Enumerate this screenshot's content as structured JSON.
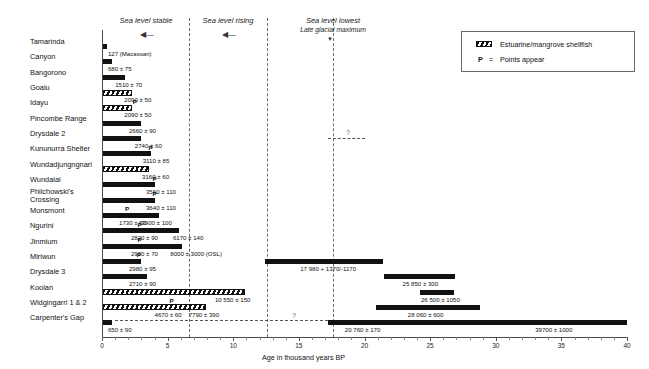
{
  "chart_data": {
    "type": "bar",
    "title": "",
    "xlabel": "Age in thousand years BP",
    "ylabel": "",
    "xlim": [
      0,
      40
    ],
    "xticks": [
      0,
      5,
      10,
      15,
      20,
      25,
      30,
      35,
      40
    ],
    "xtick_labels": [
      "0",
      "5",
      "10",
      "15",
      "20",
      "25",
      "30",
      "35",
      "40"
    ],
    "grid": false,
    "orientation": "horizontal",
    "categories": [
      "Tamarinda",
      "Canyon",
      "Bangorono",
      "Goalu",
      "Idayu",
      "Pincombe Range",
      "Drysdale 2",
      "Kununurra Shelter",
      "Wundadjungngnari",
      "Wundalal",
      "Philchowski's\nCrossing",
      "Monsmont",
      "Ngurini",
      "Jinmium",
      "Miriwun",
      "Drysdale 3",
      "Koolan",
      "Widgingarri 1 & 2",
      "Carpenter's Gap"
    ],
    "bars": [
      {
        "site": "Tamarinda",
        "segments": [
          {
            "start": 0.0,
            "end": 0.35,
            "style": "solid"
          }
        ],
        "labels": [
          {
            "text": "127 (Macassan)",
            "x": 0.45
          }
        ],
        "points": []
      },
      {
        "site": "Canyon",
        "segments": [
          {
            "start": 0.0,
            "end": 0.75,
            "style": "solid"
          }
        ],
        "labels": [
          {
            "text": "680 ± 75",
            "x": 0.45
          }
        ],
        "points": []
      },
      {
        "site": "Bangorono",
        "segments": [
          {
            "start": 0.0,
            "end": 1.75,
            "style": "solid"
          }
        ],
        "labels": [
          {
            "text": "1510 ± 70",
            "x": 1.0
          }
        ],
        "points": []
      },
      {
        "site": "Goalu",
        "segments": [
          {
            "start": 0.0,
            "end": 2.25,
            "style": "hatch"
          }
        ],
        "labels": [
          {
            "text": "2090 ± 50",
            "x": 1.7
          }
        ],
        "points": []
      },
      {
        "site": "Idayu",
        "segments": [
          {
            "start": 0.0,
            "end": 2.25,
            "style": "hatch"
          }
        ],
        "labels": [
          {
            "text": "2090 ± 50",
            "x": 1.7
          }
        ],
        "points": [
          {
            "x": 2.35
          }
        ]
      },
      {
        "site": "Pincombe Range",
        "segments": [
          {
            "start": 0.0,
            "end": 2.95,
            "style": "solid"
          }
        ],
        "labels": [
          {
            "text": "2660 ± 90",
            "x": 2.05
          }
        ],
        "points": []
      },
      {
        "site": "Drysdale 2",
        "segments": [
          {
            "start": 0.0,
            "end": 3.0,
            "style": "solid"
          }
        ],
        "labels": [
          {
            "text": "2740 ± 60",
            "x": 2.5
          }
        ],
        "points": [],
        "extra_dashed": {
          "start": 17.2,
          "end": 20.0,
          "qmark_x": 18.6
        }
      },
      {
        "site": "Kununurra Shelter",
        "segments": [
          {
            "start": 0.0,
            "end": 3.7,
            "style": "solid"
          }
        ],
        "labels": [
          {
            "text": "3110 ± 85",
            "x": 3.1
          }
        ],
        "points": [
          {
            "x": 3.55
          }
        ]
      },
      {
        "site": "Wundadjungngnari",
        "segments": [
          {
            "start": 0.0,
            "end": 3.55,
            "style": "hatch"
          }
        ],
        "labels": [
          {
            "text": "3160 ± 60",
            "x": 3.05
          }
        ],
        "points": []
      },
      {
        "site": "Wundalal",
        "segments": [
          {
            "start": 0.0,
            "end": 4.0,
            "style": "solid"
          }
        ],
        "labels": [
          {
            "text": "3560 ± 110",
            "x": 3.35
          }
        ],
        "points": [
          {
            "x": 3.85
          }
        ]
      },
      {
        "site": "Philchowski's Crossing",
        "segments": [
          {
            "start": 0.0,
            "end": 4.0,
            "style": "solid"
          }
        ],
        "labels": [
          {
            "text": "3640 ± 110",
            "x": 3.35
          }
        ],
        "points": [
          {
            "x": 3.85
          }
        ]
      },
      {
        "site": "Monsmont",
        "segments": [
          {
            "start": 0.0,
            "end": 4.35,
            "style": "solid"
          }
        ],
        "labels": [
          {
            "text": "1730 ± 50",
            "x": 1.3
          },
          {
            "text": "3900 ± 100",
            "x": 3.0
          }
        ],
        "points": [
          {
            "x": 1.75
          }
        ]
      },
      {
        "site": "Ngurini",
        "segments": [
          {
            "start": 0.0,
            "end": 5.85,
            "style": "solid"
          }
        ],
        "labels": [
          {
            "text": "2820 ± 90",
            "x": 2.2
          },
          {
            "text": "6170 ± 140",
            "x": 5.4
          }
        ],
        "points": [
          {
            "x": 2.7
          }
        ]
      },
      {
        "site": "Jinmium",
        "segments": [
          {
            "start": 0.0,
            "end": 6.1,
            "style": "solid"
          }
        ],
        "labels": [
          {
            "text": "2920 ± 70",
            "x": 2.2
          },
          {
            "text": "8000 ± 3000 (OSL)",
            "x": 5.2
          }
        ],
        "points": [
          {
            "x": 2.7
          }
        ]
      },
      {
        "site": "Miriwun",
        "segments": [
          {
            "start": 0.0,
            "end": 2.95,
            "style": "solid"
          },
          {
            "start": 12.4,
            "end": 21.4,
            "style": "solid"
          }
        ],
        "labels": [
          {
            "text": "2980 ± 95",
            "x": 2.05
          },
          {
            "text": "17 980 + 1370/-1170",
            "x": 15.1
          }
        ],
        "points": [
          {
            "x": 2.65
          }
        ]
      },
      {
        "site": "Drysdale 3",
        "segments": [
          {
            "start": 0.0,
            "end": 3.4,
            "style": "solid"
          },
          {
            "start": 21.5,
            "end": 26.9,
            "style": "solid"
          }
        ],
        "labels": [
          {
            "text": "2710 ± 90",
            "x": 2.05
          },
          {
            "text": "25 850 ± 300",
            "x": 22.9
          }
        ],
        "points": []
      },
      {
        "site": "Koolan",
        "segments": [
          {
            "start": 0.0,
            "end": 10.9,
            "style": "hatch"
          },
          {
            "start": 24.2,
            "end": 26.8,
            "style": "solid"
          }
        ],
        "labels": [
          {
            "text": "10 550 ± 150",
            "x": 8.6
          },
          {
            "text": "26 500 ± 1050",
            "x": 24.3
          }
        ],
        "points": []
      },
      {
        "site": "Widgingarri 1 & 2",
        "segments": [
          {
            "start": 0.0,
            "end": 7.9,
            "style": "hatch"
          },
          {
            "start": 20.9,
            "end": 28.8,
            "style": "solid"
          }
        ],
        "labels": [
          {
            "text": "4670 ± 60",
            "x": 4.0
          },
          {
            "text": "7790 ± 390",
            "x": 6.6
          },
          {
            "text": "28 060 ± 600",
            "x": 23.3
          }
        ],
        "points": [
          {
            "x": 5.15
          }
        ]
      },
      {
        "site": "Carpenter's Gap",
        "segments": [
          {
            "start": 0.0,
            "end": 0.75,
            "style": "solid"
          },
          {
            "start": 1.0,
            "end": 17.2,
            "style": "dashed"
          },
          {
            "start": 17.2,
            "end": 40.0,
            "style": "solid"
          }
        ],
        "labels": [
          {
            "text": "650 ± 90",
            "x": 0.45
          },
          {
            "text": "20 760 ± 170",
            "x": 18.5
          },
          {
            "text": "39700 ± 1000",
            "x": 33.0
          }
        ],
        "points": [],
        "qmark_x": 14.5
      }
    ],
    "era_markers": [
      {
        "label": "Sea level stable",
        "sublabel": "",
        "center_x": 3.35,
        "line_x": 6.6,
        "arrow": "left"
      },
      {
        "label": "Sea level rising",
        "sublabel": "",
        "center_x": 9.6,
        "line_x": 12.6,
        "arrow": "left"
      },
      {
        "label": "Sea level lowest",
        "sublabel": "Late glacial maximum",
        "center_x": 17.6,
        "line_x": 17.6,
        "arrow": "down"
      }
    ]
  },
  "legend": {
    "items": [
      {
        "icon": "hatch-swatch",
        "label": "Estuarine/mangrove shellfish"
      },
      {
        "icon": "p-letter",
        "prefix": "P",
        "equals": "=",
        "label": "Points appear"
      }
    ]
  }
}
